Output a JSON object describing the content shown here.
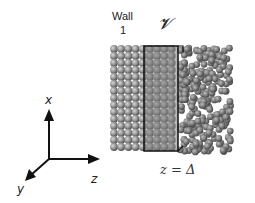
{
  "figure": {
    "labels": {
      "wall": "Wall",
      "wall_number": "1",
      "region_symbol": "𝓥",
      "interface_position": "z = Δ"
    },
    "axes": {
      "x": "x",
      "y": "y",
      "z": "z"
    },
    "regions": [
      {
        "name": "crystalline-wall",
        "description": "ordered lattice of spheres"
      },
      {
        "name": "control-volume",
        "description": "boxed region V"
      },
      {
        "name": "disordered-fluid",
        "description": "disordered packing of spheres"
      }
    ],
    "colors": {
      "sphere": "#8a8a8a",
      "sphere_highlight": "#c8c8c8",
      "box_outline": "#111111",
      "box_fill": "#7a7a7a"
    }
  }
}
